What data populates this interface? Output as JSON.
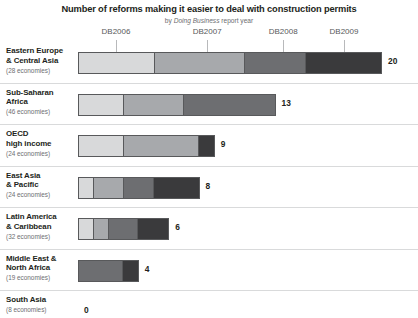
{
  "header": {
    "title": "Number of reforms making it easier to deal with construction permits",
    "subtitle_prefix": "by ",
    "subtitle_em": "Doing Business",
    "subtitle_suffix": " report year"
  },
  "chart_data": {
    "type": "bar",
    "orientation": "horizontal",
    "stacked": true,
    "title": "Number of reforms making it easier to deal with construction permits",
    "subtitle": "by Doing Business report year",
    "xlabel": "",
    "ylabel": "",
    "xlim": [
      0,
      20
    ],
    "grid": true,
    "legend_position": "top-axis-ticks",
    "tick_labels": [
      "DB2006",
      "DB2007",
      "DB2008",
      "DB2009"
    ],
    "tick_values": [
      2.5,
      8.5,
      13.5,
      17.5
    ],
    "series": [
      {
        "name": "DB2006",
        "color": "#d8d9da"
      },
      {
        "name": "DB2007",
        "color": "#a7a9ac"
      },
      {
        "name": "DB2008",
        "color": "#6d6e71"
      },
      {
        "name": "DB2009",
        "color": "#3a3a3c"
      }
    ],
    "categories": [
      "Eastern Europe & Central Asia",
      "Sub-Saharan Africa",
      "OECD high income",
      "East Asia & Pacific",
      "Latin America & Caribbean",
      "Middle East & North Africa",
      "South Asia"
    ],
    "totals": [
      20,
      13,
      9,
      8,
      6,
      4,
      0
    ],
    "values": [
      [
        5,
        6,
        4,
        5
      ],
      [
        3,
        4,
        6,
        0
      ],
      [
        3,
        5,
        0,
        1
      ],
      [
        1,
        2,
        2,
        3
      ],
      [
        1,
        1,
        2,
        2
      ],
      [
        0,
        0,
        3,
        1
      ],
      [
        0,
        0,
        0,
        0
      ]
    ]
  },
  "rows": [
    {
      "name_line1": "Eastern Europe",
      "name_line2": "& Central Asia",
      "economies": "(28 economies)",
      "total": "20",
      "segments": [
        5,
        6,
        4,
        5
      ]
    },
    {
      "name_line1": "Sub-Saharan",
      "name_line2": "Africa",
      "economies": "(46 economies)",
      "total": "13",
      "segments": [
        3,
        4,
        6,
        0
      ]
    },
    {
      "name_line1": "OECD",
      "name_line2": "high income",
      "economies": "(24 economies)",
      "total": "9",
      "segments": [
        3,
        5,
        0,
        1
      ]
    },
    {
      "name_line1": "East Asia",
      "name_line2": "& Pacific",
      "economies": "(24 economies)",
      "total": "8",
      "segments": [
        1,
        2,
        2,
        3
      ]
    },
    {
      "name_line1": "Latin America",
      "name_line2": "& Caribbean",
      "economies": "(32 economies)",
      "total": "6",
      "segments": [
        1,
        1,
        2,
        2
      ]
    },
    {
      "name_line1": "Middle East &",
      "name_line2": "North Africa",
      "economies": "(19 economies)",
      "total": "4",
      "segments": [
        0,
        0,
        3,
        1
      ]
    },
    {
      "name_line1": "South Asia",
      "name_line2": "",
      "economies": "(8 economies)",
      "total": "0",
      "segments": [
        0,
        0,
        0,
        0
      ]
    }
  ]
}
